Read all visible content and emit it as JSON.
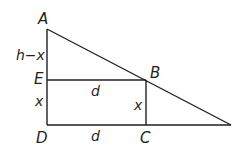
{
  "diagram": {
    "type": "geometry-figure",
    "colors": {
      "stroke": "#231f20",
      "text": "#231f20",
      "background": "#ffffff"
    },
    "vertices": {
      "A": "A",
      "B": "B",
      "C": "C",
      "D": "D",
      "E": "E"
    },
    "segment_labels": {
      "AE": "h−x",
      "ED": "x",
      "EB": "d",
      "BC": "x",
      "DC": "d"
    }
  }
}
